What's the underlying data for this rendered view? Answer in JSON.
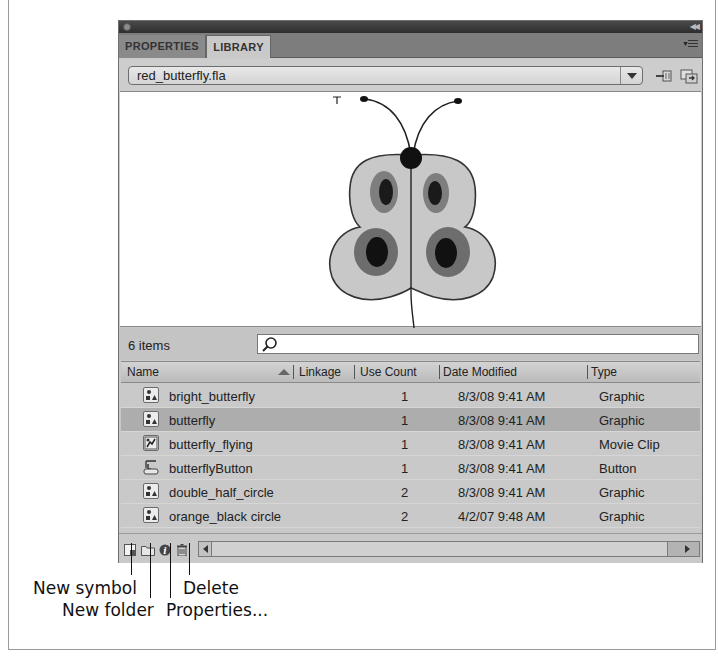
{
  "panel": {
    "tabs": [
      {
        "label": "PROPERTIES",
        "active": false
      },
      {
        "label": "LIBRARY",
        "active": true
      }
    ],
    "document_select": {
      "value": "red_butterfly.fla"
    },
    "icons": {
      "pin": "pin-library-icon",
      "new_library": "new-library-panel-icon",
      "menu": "panel-menu-icon",
      "collapse": "collapse-icon"
    },
    "preview": {
      "symbol": "butterfly"
    },
    "items_count": "6 items",
    "search": {
      "placeholder": "",
      "value": ""
    },
    "columns": [
      "Name",
      "Linkage",
      "Use Count",
      "Date Modified",
      "Type"
    ],
    "sort": {
      "column": "Name",
      "direction": "ascending"
    },
    "items": [
      {
        "name": "bright_butterfly",
        "linkage": "",
        "use_count": "1",
        "date_modified": "8/3/08 9:41 AM",
        "type": "Graphic",
        "icon": "graphic-symbol-icon",
        "selected": false
      },
      {
        "name": "butterfly",
        "linkage": "",
        "use_count": "1",
        "date_modified": "8/3/08 9:41 AM",
        "type": "Graphic",
        "icon": "graphic-symbol-icon",
        "selected": true
      },
      {
        "name": "butterfly_flying",
        "linkage": "",
        "use_count": "1",
        "date_modified": "8/3/08 9:41 AM",
        "type": "Movie Clip",
        "icon": "movie-clip-icon",
        "selected": false
      },
      {
        "name": "butterflyButton",
        "linkage": "",
        "use_count": "1",
        "date_modified": "8/3/08 9:41 AM",
        "type": "Button",
        "icon": "button-symbol-icon",
        "selected": false
      },
      {
        "name": "double_half_circle",
        "linkage": "",
        "use_count": "2",
        "date_modified": "8/3/08 9:41 AM",
        "type": "Graphic",
        "icon": "graphic-symbol-icon",
        "selected": false
      },
      {
        "name": "orange_black circle",
        "linkage": "",
        "use_count": "2",
        "date_modified": "4/2/07 9:48 AM",
        "type": "Graphic",
        "icon": "graphic-symbol-icon",
        "selected": false
      }
    ],
    "bottom_tools": [
      {
        "name": "new-symbol",
        "icon": "new-symbol-icon"
      },
      {
        "name": "new-folder",
        "icon": "folder-icon"
      },
      {
        "name": "properties",
        "icon": "info-icon"
      },
      {
        "name": "delete",
        "icon": "trash-icon"
      }
    ]
  },
  "callouts": {
    "new_symbol": "New symbol",
    "new_folder": "New folder",
    "properties": "Properties...",
    "delete": "Delete"
  }
}
